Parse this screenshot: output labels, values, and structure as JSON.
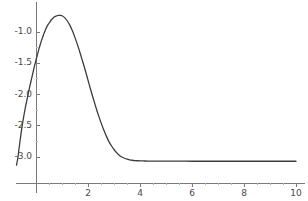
{
  "figure": {
    "width": 308,
    "height": 201,
    "background": "#ffffff",
    "curve_color": "#3c3c3c",
    "axis_color": "#7a7a7a",
    "tick_label_color": "#4a4a4a"
  },
  "chart_data": {
    "type": "line",
    "title": "",
    "xlabel": "",
    "ylabel": "",
    "xlim": [
      -0.78,
      10.2
    ],
    "ylim": [
      -3.18,
      -0.62
    ],
    "grid": false,
    "legend": null,
    "axis_style": "spines-cross",
    "x_ticks": [
      2,
      4,
      6,
      8,
      10
    ],
    "x_tick_labels": [
      "2",
      "4",
      "6",
      "8",
      "10"
    ],
    "y_ticks": [
      -1.0,
      -1.5,
      -2.0,
      -2.5,
      -3.0
    ],
    "y_tick_labels": [
      "-1.0",
      "-1.5",
      "-2.0",
      "-2.5",
      "-3.0"
    ],
    "x_minor_ticks": [
      0.5,
      1,
      1.5,
      2.5,
      3,
      3.5,
      4.5,
      5,
      5.5,
      6.5,
      7,
      7.5,
      8.5,
      9,
      9.5
    ],
    "y_minor_ticks": [
      -1.25,
      -1.75,
      -2.25,
      -2.75
    ],
    "series": [
      {
        "name": "curve",
        "x": [
          -0.75,
          -0.7,
          -0.65,
          -0.6,
          -0.55,
          -0.5,
          -0.45,
          -0.4,
          -0.35,
          -0.3,
          -0.25,
          -0.2,
          -0.15,
          -0.1,
          -0.05,
          0.0,
          0.05,
          0.1,
          0.15,
          0.2,
          0.25,
          0.3,
          0.35,
          0.4,
          0.45,
          0.5,
          0.55,
          0.6,
          0.65,
          0.7,
          0.75,
          0.8,
          0.85,
          0.9,
          0.95,
          1.0,
          1.1,
          1.2,
          1.3,
          1.4,
          1.5,
          1.6,
          1.7,
          1.8,
          1.9,
          2.0,
          2.1,
          2.2,
          2.3,
          2.4,
          2.5,
          2.6,
          2.7,
          2.8,
          2.9,
          3.0,
          3.1,
          3.2,
          3.3,
          3.4,
          3.5,
          3.6,
          3.7,
          3.8,
          3.9,
          4.0,
          4.2,
          4.4,
          4.6,
          4.8,
          5.0,
          5.5,
          6.0,
          6.5,
          7.0,
          7.5,
          8.0,
          8.5,
          9.0,
          9.5,
          10.0
        ],
        "y": [
          -3.13,
          -3.02,
          -2.86,
          -2.7,
          -2.55,
          -2.42,
          -2.3,
          -2.19,
          -2.09,
          -1.99,
          -1.89,
          -1.8,
          -1.71,
          -1.62,
          -1.53,
          -1.45,
          -1.37,
          -1.29,
          -1.22,
          -1.15,
          -1.09,
          -1.03,
          -0.98,
          -0.93,
          -0.89,
          -0.86,
          -0.83,
          -0.8,
          -0.78,
          -0.76,
          -0.75,
          -0.74,
          -0.735,
          -0.733,
          -0.735,
          -0.74,
          -0.77,
          -0.82,
          -0.89,
          -0.98,
          -1.09,
          -1.21,
          -1.34,
          -1.48,
          -1.62,
          -1.77,
          -1.92,
          -2.06,
          -2.2,
          -2.33,
          -2.45,
          -2.56,
          -2.66,
          -2.75,
          -2.82,
          -2.88,
          -2.93,
          -2.97,
          -3.0,
          -3.02,
          -3.035,
          -3.045,
          -3.052,
          -3.057,
          -3.06,
          -3.062,
          -3.064,
          -3.065,
          -3.066,
          -3.066,
          -3.067,
          -3.067,
          -3.068,
          -3.068,
          -3.068,
          -3.068,
          -3.068,
          -3.068,
          -3.068,
          -3.068,
          -3.068
        ],
        "color": "#3c3c3c",
        "linewidth": 1.3
      }
    ]
  }
}
